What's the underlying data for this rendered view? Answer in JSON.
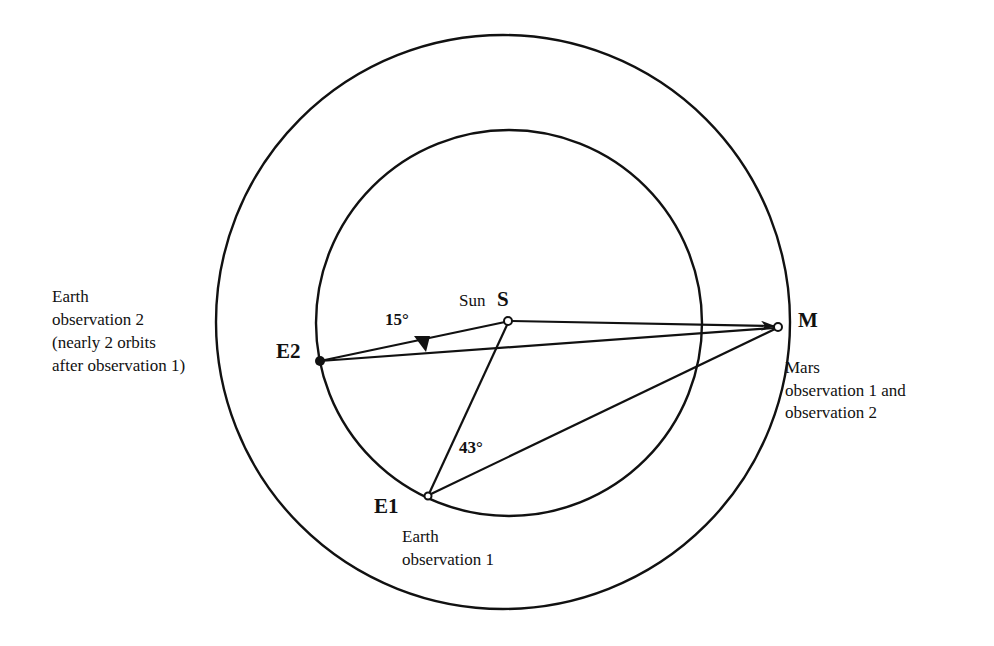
{
  "diagram": {
    "labels": {
      "sun_word": "Sun",
      "sun_letter": "S",
      "mars_letter": "M",
      "e1_letter": "E1",
      "e2_letter": "E2",
      "angle_15": "15°",
      "angle_43": "43°"
    },
    "earth_obs2_caption": [
      "Earth",
      "observation 2",
      "(nearly 2 orbits",
      "after observation 1)"
    ],
    "mars_caption": [
      "Mars",
      "observation 1 and",
      "observation 2"
    ],
    "earth_obs1_caption": [
      "Earth",
      "observation 1"
    ],
    "geometry": {
      "outer_orbit": {
        "cx": 503,
        "cy": 322,
        "r": 287
      },
      "inner_orbit": {
        "cx": 509,
        "cy": 323,
        "r": 193
      },
      "sun": {
        "x": 508,
        "y": 321
      },
      "mars": {
        "x": 778,
        "y": 327
      },
      "e1": {
        "x": 428,
        "y": 496
      },
      "e2": {
        "x": 320,
        "y": 361
      }
    }
  }
}
